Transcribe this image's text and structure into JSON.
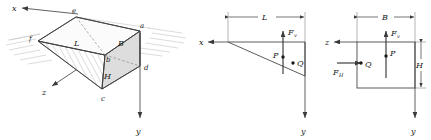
{
  "figure": {
    "background_color": "#ffffff",
    "line_color": "#3a3a3a",
    "fill_color": "#d8d8d8",
    "hatch_color": "#9a9a9a",
    "panels": [
      {
        "id": "panel-3d-wedge",
        "type": "axonometric-prism"
      },
      {
        "id": "panel-side-elevation",
        "type": "triangle-section"
      },
      {
        "id": "panel-front-elevation",
        "type": "rectangle-section"
      }
    ]
  },
  "panel1": {
    "name": "three-dimensional-wedge",
    "axes": {
      "x": "x",
      "y": "y",
      "z": "z"
    },
    "vertices": {
      "e": "e",
      "f": "f",
      "a": "a",
      "b": "b",
      "c": "c",
      "d": "d"
    },
    "dimensions": {
      "L": "L",
      "B": "B",
      "H": "H"
    }
  },
  "panel2": {
    "name": "side-elevation",
    "axes": {
      "x": "x",
      "y": "y"
    },
    "dimension_L": "L",
    "force_vertical": "F",
    "force_vertical_sub": "v",
    "points": {
      "P": "P",
      "Q": "Q"
    }
  },
  "panel3": {
    "name": "front-elevation",
    "axes": {
      "z": "z",
      "y": "y"
    },
    "dimension_B": "B",
    "dimension_H": "H",
    "force_vertical": "F",
    "force_vertical_sub": "v",
    "force_horizontal": "F",
    "force_horizontal_sub": "H",
    "points": {
      "P": "P",
      "Q": "Q"
    }
  }
}
